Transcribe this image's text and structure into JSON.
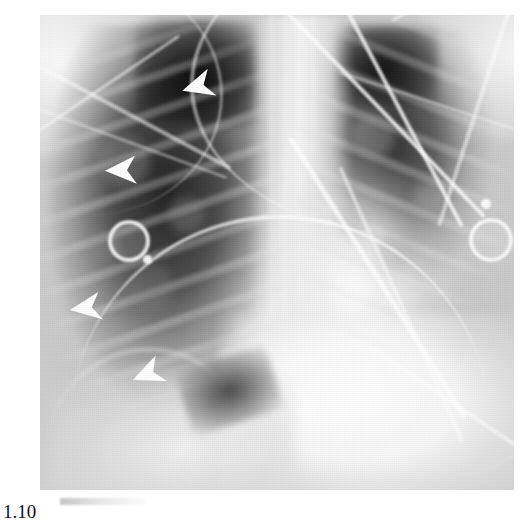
{
  "figure": {
    "modality": "chest-radiograph",
    "view": "AP portable frontal chest X-ray",
    "caption_fragment": "1.10",
    "caption_visible": "partially clipped at bottom edge"
  },
  "image": {
    "frame": {
      "left": 40,
      "top": 15,
      "width": 474,
      "height": 475
    },
    "background_color": "#ffffff",
    "film_light": "#f5f5f5",
    "film_mid": "#c8c8c8",
    "film_dark": "#141414",
    "marker_color": "#ffffff"
  },
  "annotations": {
    "arrowheads": [
      {
        "id": "arrowhead-1",
        "label": "upper right lung marker",
        "x": 174,
        "y": 72,
        "size": 38,
        "rotation": -18
      },
      {
        "id": "arrowhead-2",
        "label": "mid right lung marker",
        "x": 97,
        "y": 153,
        "size": 38,
        "rotation": -4
      },
      {
        "id": "arrowhead-3",
        "label": "lower right lung marker",
        "x": 62,
        "y": 293,
        "size": 38,
        "rotation": -10
      },
      {
        "id": "arrowhead-4",
        "label": "basal right lung marker",
        "x": 124,
        "y": 362,
        "size": 38,
        "rotation": -22
      }
    ],
    "electrodes": [
      {
        "id": "ecg-electrode-left",
        "x": 68,
        "y": 205,
        "diameter": 34
      },
      {
        "id": "ecg-electrode-right",
        "x": 469,
        "y": 203,
        "diameter": 36
      }
    ],
    "snaps": [
      {
        "id": "electrode-snap-left",
        "x": 103,
        "y": 240,
        "diameter": 9
      },
      {
        "id": "electrode-snap-right",
        "x": 481,
        "y": 184,
        "diameter": 10
      }
    ]
  },
  "structures": {
    "right_lung": "hyperlucent aerated right lung field with visible rib shadows",
    "left_lung": "aerated left upper lung with overlying monitoring leads",
    "mediastinum": "central dense mediastinal and spinal column",
    "heart": "dense cardiac silhouette left of midline",
    "diaphragm": "dense sub-diaphragmatic region lower field",
    "hardware": "external ECG leads and tubing crossing the field"
  }
}
